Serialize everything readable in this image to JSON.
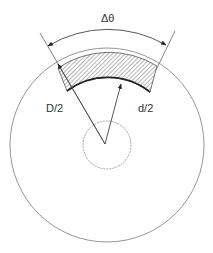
{
  "diagram": {
    "labels": {
      "angle": "Δθ",
      "outer_radius": "D/2",
      "inner_radius": "d/2"
    },
    "colors": {
      "line": "#555555",
      "hatch": "#777777",
      "text": "#333333"
    },
    "elements": [
      "outer-circle",
      "inner-circle",
      "shaded-annular-sector",
      "angle-arc-with-arrows",
      "radial-boundary-lines",
      "D/2-radius-arrow",
      "d/2-radius-arrow"
    ]
  }
}
